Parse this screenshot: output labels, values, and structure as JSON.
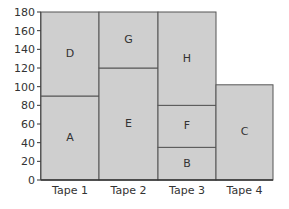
{
  "chart_data": {
    "type": "bar",
    "subtype": "stacked",
    "title": "",
    "xlabel": "",
    "ylabel": "",
    "ylim": [
      0,
      180
    ],
    "yticks": [
      0,
      20,
      40,
      60,
      80,
      100,
      120,
      140,
      160,
      180
    ],
    "categories": [
      "Tape 1",
      "Tape 2",
      "Tape 3",
      "Tape 4"
    ],
    "grid": false,
    "legend": null,
    "segments": [
      {
        "category": "Tape 1",
        "label": "A",
        "start": 0,
        "end": 90
      },
      {
        "category": "Tape 1",
        "label": "D",
        "start": 90,
        "end": 180
      },
      {
        "category": "Tape 2",
        "label": "E",
        "start": 0,
        "end": 120
      },
      {
        "category": "Tape 2",
        "label": "G",
        "start": 120,
        "end": 180
      },
      {
        "category": "Tape 3",
        "label": "B",
        "start": 0,
        "end": 35
      },
      {
        "category": "Tape 3",
        "label": "F",
        "start": 35,
        "end": 80
      },
      {
        "category": "Tape 3",
        "label": "H",
        "start": 80,
        "end": 180
      },
      {
        "category": "Tape 4",
        "label": "C",
        "start": 0,
        "end": 102
      }
    ],
    "colors": {
      "fill": "#cfcfcf",
      "stroke": "#555555",
      "axis": "#333333"
    }
  }
}
